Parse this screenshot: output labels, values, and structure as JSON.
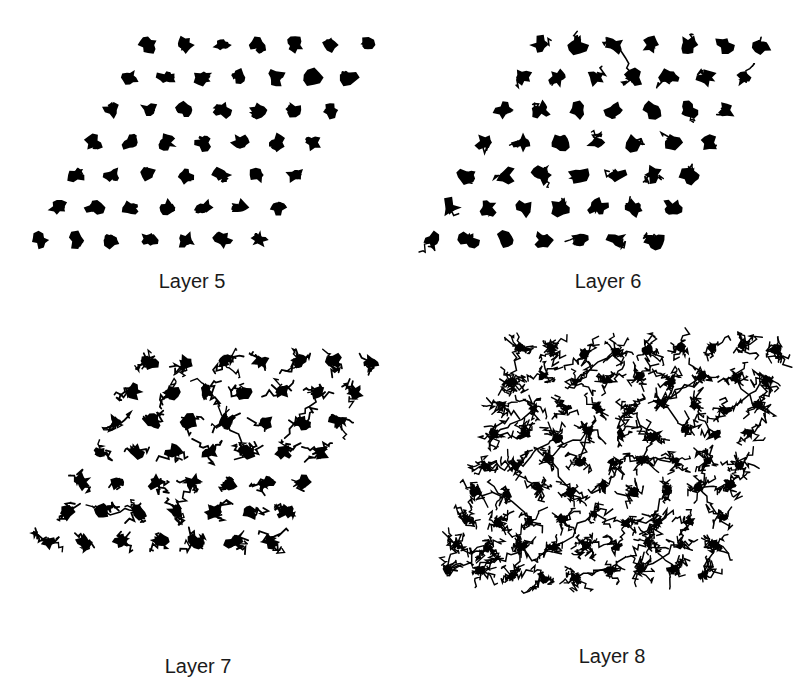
{
  "figure": {
    "background": "#ffffff",
    "ink": "#000000",
    "panels": [
      {
        "id": "layer-5",
        "caption": "Layer 5",
        "caption_pos": [
          92,
          270
        ],
        "grid": {
          "rows": 7,
          "cols": 7,
          "origin": [
            148,
            45
          ],
          "dx": 36.5,
          "row_shift": [
            -18,
            32.5
          ]
        },
        "style": "compact",
        "connections": 0
      },
      {
        "id": "layer-6",
        "caption": "Layer 6",
        "caption_pos": [
          508,
          270
        ],
        "grid": {
          "rows": 7,
          "cols": 7,
          "origin": [
            540,
            45
          ],
          "dx": 37,
          "row_shift": [
            -18,
            32.5
          ]
        },
        "style": "compact-loose",
        "connections": 12
      },
      {
        "id": "layer-7",
        "caption": "Layer 7",
        "caption_pos": [
          98,
          655
        ],
        "grid": {
          "rows": 7,
          "cols": 7,
          "origin": [
            150,
            362
          ],
          "dx": 37,
          "row_shift": [
            -17,
            30
          ]
        },
        "style": "branched",
        "connections": 60
      },
      {
        "id": "layer-8",
        "caption": "Layer 8",
        "caption_pos": [
          512,
          645
        ],
        "grid": {
          "rows": 9,
          "cols": 9,
          "origin": [
            520,
            350
          ],
          "dx": 32,
          "row_shift": [
            -9,
            28
          ]
        },
        "style": "network",
        "connections": 420
      }
    ]
  }
}
